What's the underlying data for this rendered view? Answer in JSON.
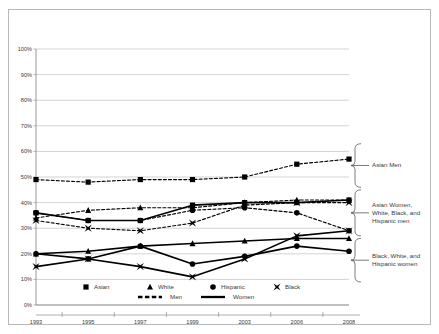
{
  "chart_data": {
    "type": "line",
    "title": "",
    "subtitle": "",
    "xlabel": "",
    "ylabel": "",
    "categories": [
      "1993",
      "1995",
      "1997",
      "1999",
      "2003",
      "2006",
      "2008"
    ],
    "x": [
      1993,
      1995,
      1997,
      1999,
      2003,
      2006,
      2008
    ],
    "ylim": [
      0,
      100
    ],
    "yticks": [
      0,
      10,
      20,
      30,
      40,
      50,
      60,
      70,
      80,
      90,
      100
    ],
    "ytick_labels": [
      "0%",
      "10%",
      "20%",
      "30%",
      "40%",
      "50%",
      "60%",
      "70%",
      "80%",
      "90%",
      "100%"
    ],
    "grid": true,
    "grid_color": "#c0c0c0",
    "legend_position": "bottom",
    "line_color": "#000000",
    "series": [
      {
        "name": "Asian Men",
        "race": "Asian",
        "gender": "Men",
        "marker": "square",
        "style": "dashed",
        "values": [
          49,
          48,
          49,
          49,
          50,
          55,
          57
        ]
      },
      {
        "name": "White Men",
        "race": "White",
        "gender": "Men",
        "marker": "triangle",
        "style": "dashed",
        "values": [
          34,
          37,
          38,
          38,
          40,
          41,
          41
        ]
      },
      {
        "name": "Hispanic Men",
        "race": "Hispanic",
        "gender": "Men",
        "marker": "circle",
        "style": "dashed",
        "values": [
          36,
          33,
          33,
          37,
          38,
          36,
          29
        ]
      },
      {
        "name": "Black Men",
        "race": "Black",
        "gender": "Men",
        "marker": "bowtie",
        "style": "dashed",
        "values": [
          33,
          30,
          29,
          32,
          39,
          40,
          40
        ]
      },
      {
        "name": "Asian Women",
        "race": "Asian",
        "gender": "Women",
        "marker": "square",
        "style": "solid",
        "values": [
          36,
          33,
          33,
          39,
          40,
          40,
          41
        ]
      },
      {
        "name": "White Women",
        "race": "White",
        "gender": "Women",
        "marker": "triangle",
        "style": "solid",
        "values": [
          20,
          21,
          23,
          24,
          25,
          26,
          26
        ]
      },
      {
        "name": "Hispanic Women",
        "race": "Hispanic",
        "gender": "Women",
        "marker": "circle",
        "style": "solid",
        "values": [
          20,
          18,
          23,
          16,
          19,
          23,
          21
        ]
      },
      {
        "name": "Black Women",
        "race": "Black",
        "gender": "Women",
        "marker": "bowtie",
        "style": "solid",
        "values": [
          15,
          18,
          15,
          11,
          18,
          27,
          29
        ]
      }
    ],
    "legend": {
      "markers": [
        {
          "label": "Asian",
          "marker": "square"
        },
        {
          "label": "White",
          "marker": "triangle"
        },
        {
          "label": "Hispanic",
          "marker": "circle"
        },
        {
          "label": "Black",
          "marker": "bowtie"
        }
      ],
      "styles": [
        {
          "label": "Men",
          "style": "dashed"
        },
        {
          "label": "Women",
          "style": "solid"
        }
      ]
    },
    "annotations": [
      {
        "id": "asian-men",
        "lines": [
          "Asian Men"
        ],
        "brace_top_pct": 63,
        "brace_bottom_pct": 46
      },
      {
        "id": "asian-women-white-black-hispanic-men",
        "lines": [
          "Asian Women,",
          "White, Black, and",
          "Hispanic men"
        ],
        "brace_top_pct": 45,
        "brace_bottom_pct": 27
      },
      {
        "id": "black-white-hispanic-women",
        "lines": [
          "Black, White, and",
          "Hispanic women"
        ],
        "brace_top_pct": 26,
        "brace_bottom_pct": 9
      }
    ]
  }
}
